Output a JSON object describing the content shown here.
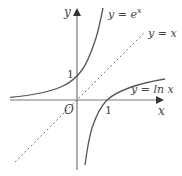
{
  "figure": {
    "axes": {
      "x_label": "x",
      "y_label": "y",
      "origin_label": "O",
      "x_tick_label": "1",
      "y_tick_label": "1"
    },
    "curves": [
      {
        "name": "exp",
        "label_lhs": "y = e",
        "label_sup": "x",
        "style": "solid"
      },
      {
        "name": "identity",
        "label": "y = x",
        "style": "dashed"
      },
      {
        "name": "log",
        "label": "y = ln x",
        "style": "solid"
      }
    ],
    "colors": {
      "axes": "#666666",
      "curve": "#555555",
      "dashed": "#777777",
      "text": "#444444"
    }
  }
}
